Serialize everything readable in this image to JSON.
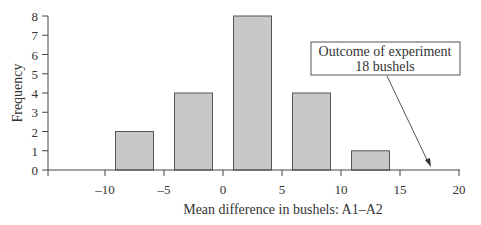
{
  "chart_data": {
    "type": "bar",
    "title": "",
    "xlabel": "Mean difference in bushels: A1–A2",
    "ylabel": "Frequency",
    "categories": [
      "-10 to -5",
      "-5 to 0",
      "0 to 5",
      "5 to 10",
      "10 to 15"
    ],
    "bins": [
      {
        "left": -10,
        "right": -5,
        "center": -7.5,
        "value": 2
      },
      {
        "left": -5,
        "right": 0,
        "center": -2.5,
        "value": 4
      },
      {
        "left": 0,
        "right": 5,
        "center": 2.5,
        "value": 8
      },
      {
        "left": 5,
        "right": 10,
        "center": 7.5,
        "value": 4
      },
      {
        "left": 10,
        "right": 15,
        "center": 12.5,
        "value": 1
      }
    ],
    "values": [
      2,
      4,
      8,
      4,
      1
    ],
    "xlim": [
      -15,
      20
    ],
    "ylim": [
      0,
      8
    ],
    "x_ticks": [
      -10,
      -5,
      0,
      5,
      10,
      15,
      20
    ],
    "x_tick_labels": [
      "–10",
      "–5",
      "0",
      "5",
      "10",
      "15",
      "20"
    ],
    "y_ticks": [
      0,
      1,
      2,
      3,
      4,
      5,
      6,
      7,
      8
    ],
    "y_tick_labels": [
      "0",
      "1",
      "2",
      "3",
      "4",
      "5",
      "6",
      "7",
      "8"
    ],
    "grid": false,
    "legend": null,
    "annotation": {
      "line1": "Outcome of experiment",
      "line2": "18 bushels",
      "points_to_x": 18
    },
    "colors": {
      "bar_fill": "#c8c8c8",
      "bar_stroke": "#555555",
      "axis": "#444444"
    }
  }
}
